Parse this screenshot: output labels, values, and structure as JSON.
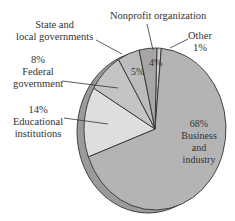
{
  "chart_data": {
    "type": "pie",
    "title": "",
    "categories": [
      "Business and industry",
      "Educational institutions",
      "Federal government",
      "State and local governments",
      "Nonprofit organization",
      "Other"
    ],
    "values": [
      68,
      14,
      8,
      5,
      4,
      1
    ],
    "unit": "%",
    "colors": {
      "Business and industry": "#b4b4b4",
      "Educational institutions": "#dedede",
      "Federal government": "#c4c4c4",
      "State and local governments": "#bcbcbc",
      "Nonprofit organization": "#a6a6a6",
      "Other": "#cfcfcf",
      "rim": "#9a9a9a",
      "rim_dark": "#8a8a8a",
      "outline": "#333333"
    },
    "labels": {
      "business": {
        "pct": "68%",
        "line1": "Business",
        "line2": "and",
        "line3": "industry"
      },
      "educational": {
        "pct": "14%",
        "line1": "Educational",
        "line2": "institutions"
      },
      "federal": {
        "pct": "8%",
        "line1": "Federal",
        "line2": "government"
      },
      "state": {
        "line1": "State and",
        "line2": "local governments",
        "pct": "5%"
      },
      "nonprofit": {
        "line1": "Nonprofit organization",
        "pct": "4%"
      },
      "other": {
        "line1": "Other",
        "pct": "1%"
      }
    },
    "legend": "none (callout labels)"
  }
}
